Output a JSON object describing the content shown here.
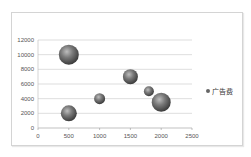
{
  "chart_data": {
    "type": "bubble",
    "title": "",
    "xlabel": "",
    "ylabel": "",
    "xlim": [
      0,
      2500
    ],
    "ylim": [
      0,
      12000
    ],
    "x_ticks": [
      "0",
      "500",
      "1000",
      "1500",
      "2000",
      "2500"
    ],
    "y_ticks": [
      "0",
      "2000",
      "4000",
      "6000",
      "8000",
      "10000",
      "12000"
    ],
    "grid": "horizontal",
    "legend_position": "right",
    "series": [
      {
        "name": "广告费",
        "color": "#6b6b6b",
        "points": [
          {
            "x": 500,
            "y": 10000,
            "size": 10
          },
          {
            "x": 500,
            "y": 2000,
            "size": 8
          },
          {
            "x": 1000,
            "y": 4000,
            "size": 5.5
          },
          {
            "x": 1500,
            "y": 7000,
            "size": 7.5
          },
          {
            "x": 1800,
            "y": 5000,
            "size": 5
          },
          {
            "x": 2000,
            "y": 3500,
            "size": 9.5
          }
        ]
      }
    ]
  },
  "legend": {
    "label": "广告费"
  }
}
